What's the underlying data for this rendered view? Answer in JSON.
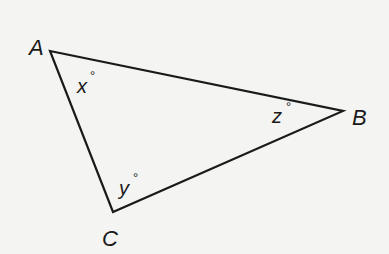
{
  "diagram": {
    "type": "triangle",
    "stroke_color": "#1a1a1a",
    "background": "#f4f4f2",
    "vertices": [
      {
        "name": "A",
        "x": 50,
        "y": 51
      },
      {
        "name": "B",
        "x": 343,
        "y": 111
      },
      {
        "name": "C",
        "x": 113,
        "y": 212
      }
    ],
    "vertex_labels": {
      "A": "A",
      "B": "B",
      "C": "C"
    },
    "angle_labels": {
      "A": {
        "var": "x",
        "degree": "°"
      },
      "B": {
        "var": "z",
        "degree": "°"
      },
      "C": {
        "var": "y",
        "degree": "°"
      }
    }
  }
}
